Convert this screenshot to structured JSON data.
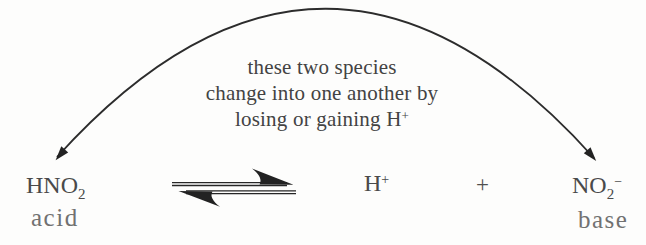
{
  "colors": {
    "background": "#fdfdfc",
    "arrow_ink": "#262626",
    "formula_text": "#4a4a4a",
    "annotation_text": "#434343",
    "role_label_text": "#717171"
  },
  "annotation": {
    "lines": [
      {
        "text": "these two species"
      },
      {
        "text": "change into one another by"
      },
      {
        "text": "losing or gaining H",
        "superscript": "+"
      }
    ]
  },
  "icons": {
    "curved_arrow": "double-headed-curved-arc",
    "reaction_arrow": "equilibrium-double-harpoon"
  },
  "equation": {
    "reactant": {
      "formula": "HNO",
      "subscript": "2",
      "label": "acid"
    },
    "product_1": {
      "formula": "H",
      "superscript": "+"
    },
    "plus_operator": "+",
    "product_2": {
      "formula": "NO",
      "subscript": "2",
      "superscript": "−",
      "label": "base"
    }
  }
}
